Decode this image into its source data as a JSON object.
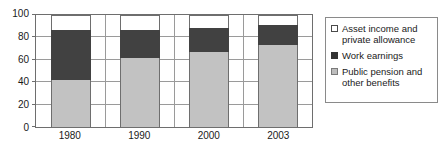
{
  "chart_data": {
    "type": "bar",
    "stacked": true,
    "title": "",
    "xlabel": "",
    "ylabel": "",
    "categories": [
      "1980",
      "1990",
      "2000",
      "2003"
    ],
    "series": [
      {
        "name": "Public pension and other benefits",
        "color": "#c2c2c2",
        "values": [
          42,
          62,
          67,
          73
        ]
      },
      {
        "name": "Work earnings",
        "color": "#414141",
        "values": [
          45,
          25,
          21,
          18
        ]
      },
      {
        "name": "Asset income and private allowance",
        "color": "#ffffff",
        "values": [
          13,
          13,
          12,
          9
        ]
      }
    ],
    "cumulative_tops": [
      [
        42,
        87,
        100
      ],
      [
        62,
        87,
        100
      ],
      [
        67,
        88,
        100
      ],
      [
        73,
        91,
        100
      ]
    ],
    "ylim": [
      0,
      100
    ],
    "yticks": [
      "0",
      "20",
      "40",
      "60",
      "80",
      "100"
    ],
    "ytick_values": [
      0,
      20,
      40,
      60,
      80,
      100
    ],
    "grid": "horizontal-and-vertical",
    "legend_position": "right"
  },
  "legend": {
    "items": [
      {
        "label_line1": "Asset income and",
        "label_line2": "private allowance",
        "swatch": "asset-swatch"
      },
      {
        "label_line1": "Work earnings",
        "label_line2": "",
        "swatch": "work-swatch"
      },
      {
        "label_line1": "Public pension and",
        "label_line2": "other benefits",
        "swatch": "pension-swatch"
      }
    ]
  }
}
